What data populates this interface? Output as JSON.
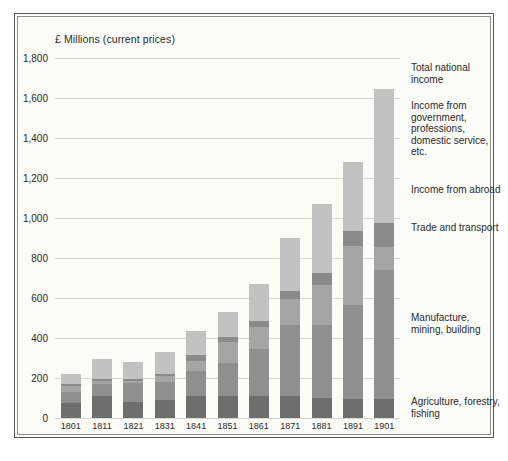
{
  "chart_data": {
    "type": "bar",
    "stacked": true,
    "title": "",
    "axis_title": "£ Millions (current prices)",
    "xlabel": "",
    "ylabel": "£ Millions (current prices)",
    "ylim": [
      0,
      1800
    ],
    "ytick_step": 200,
    "grid": true,
    "legend_position": "right",
    "categories": [
      "1801",
      "1811",
      "1821",
      "1831",
      "1841",
      "1851",
      "1861",
      "1871",
      "1881",
      "1891",
      "1901"
    ],
    "ytick_labels": [
      "0",
      "200",
      "400",
      "600",
      "800",
      "1,000",
      "1,200",
      "1,400",
      "1,600",
      "1,800"
    ],
    "series": [
      {
        "name": "Agriculture, forestry, fishing",
        "color": "#6e6e6e",
        "values": [
          75,
          110,
          80,
          90,
          110,
          110,
          110,
          110,
          100,
          95,
          95
        ]
      },
      {
        "name": "Manufacture, mining, building",
        "color": "#8f8f8f",
        "values": [
          55,
          60,
          95,
          90,
          125,
          165,
          235,
          355,
          365,
          470,
          645
        ]
      },
      {
        "name": "Trade and transport",
        "color": "#a5a5a5",
        "values": [
          30,
          15,
          10,
          30,
          50,
          105,
          110,
          130,
          200,
          295,
          115
        ]
      },
      {
        "name": "Income from abroad",
        "color": "#8a8a8a",
        "values": [
          10,
          10,
          10,
          10,
          30,
          25,
          30,
          40,
          60,
          75,
          120
        ]
      },
      {
        "name": "Income from government, professions, domestic service, etc.",
        "color": "#c2c2c2",
        "values": [
          50,
          100,
          85,
          110,
          120,
          125,
          185,
          265,
          345,
          345,
          670
        ]
      }
    ],
    "totals": [
      220,
      295,
      280,
      330,
      435,
      530,
      670,
      900,
      1070,
      1280,
      1645
    ],
    "legend_entries": [
      {
        "label": "Total national income",
        "top": 62
      },
      {
        "label": "Income from government, professions, domestic service, etc.",
        "top": 100
      },
      {
        "label": "Income from abroad",
        "top": 184
      },
      {
        "label": "Trade and transport",
        "top": 222
      },
      {
        "label": "Manufacture, mining, building",
        "top": 312
      },
      {
        "label": "Agriculture, forestry, fishing",
        "top": 396
      }
    ]
  }
}
